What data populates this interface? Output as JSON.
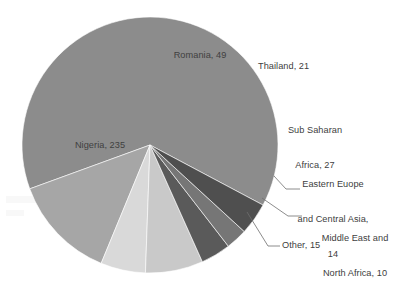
{
  "chart_data": {
    "type": "pie",
    "title": "",
    "subtitle": "",
    "xlabel": "",
    "ylabel": "",
    "total": 371,
    "legend_position": "none",
    "grid": false,
    "data_labels": true,
    "label_format": "{name}, {value}",
    "start_angle_deg": 30,
    "direction": "clockwise",
    "categories": [
      "Nigeria",
      "Romania",
      "Thailand",
      "Sub Saharan Africa",
      "Eastern Euope and Central Asia",
      "Middle East and North Africa",
      "Other"
    ],
    "values": [
      235,
      49,
      21,
      27,
      14,
      10,
      15
    ],
    "colors": [
      "#8c8c8c",
      "#a6a6a6",
      "#d9d9d9",
      "#c9c9c9",
      "#5a5a5a",
      "#767676",
      "#4f4f4f"
    ],
    "slices": [
      {
        "name": "Nigeria",
        "value": 235,
        "percent": 63.3,
        "color": "#8c8c8c"
      },
      {
        "name": "Romania",
        "value": 49,
        "percent": 13.2,
        "color": "#a6a6a6"
      },
      {
        "name": "Thailand",
        "value": 21,
        "percent": 5.7,
        "color": "#d9d9d9"
      },
      {
        "name": "Sub Saharan Africa",
        "value": 27,
        "percent": 7.3,
        "color": "#c9c9c9"
      },
      {
        "name": "Eastern Euope and Central Asia",
        "value": 14,
        "percent": 3.8,
        "color": "#5a5a5a"
      },
      {
        "name": "Middle East and North Africa",
        "value": 10,
        "percent": 2.7,
        "color": "#767676"
      },
      {
        "name": "Other",
        "value": 15,
        "percent": 4.0,
        "color": "#4f4f4f"
      }
    ]
  },
  "labels": {
    "nigeria": {
      "text": "Nigeria, 235"
    },
    "romania": {
      "text": "Romania, 49"
    },
    "thailand": {
      "text": "Thailand, 21"
    },
    "sub_saharan": {
      "line1": "Sub Saharan",
      "line2": "Africa, 27"
    },
    "eastern_europe": {
      "line1": "Eastern Euope",
      "line2": "and Central Asia,",
      "line3": "14"
    },
    "middle_east": {
      "line1": "Middle East and",
      "line2": "North Africa, 10"
    },
    "other": {
      "text": "Other, 15"
    }
  },
  "style": {
    "background": "#ffffff",
    "label_color": "#404040",
    "leader_line_color": "#6e6e6e"
  }
}
